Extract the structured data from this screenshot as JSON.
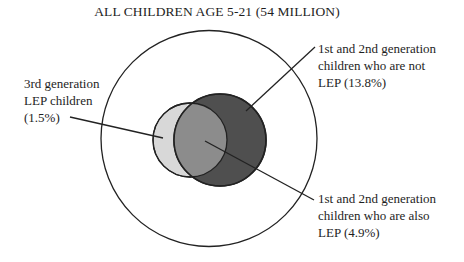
{
  "title": "ALL CHILDREN AGE 5-21 (54 MILLION)",
  "colors": {
    "outer_fill": "#ffffff",
    "third_gen_lep_fill": "#d8d8d8",
    "overlap_fill": "#8c8c8c",
    "first_second_gen_fill": "#4f4f4f",
    "stroke": "#222222"
  },
  "labels": {
    "third_gen": {
      "lines": [
        "3rd generation",
        "LEP children",
        "(1.5%)"
      ]
    },
    "not_lep": {
      "lines": [
        "1st and 2nd generation",
        "children who are not",
        "LEP (13.8%)"
      ]
    },
    "also_lep": {
      "lines": [
        "1st and 2nd generation",
        "children who are also",
        "LEP (4.9%)"
      ]
    }
  },
  "sets": [
    {
      "name": "All children age 5-21",
      "value": "54 million"
    },
    {
      "name": "3rd generation LEP children",
      "value": "1.5%"
    },
    {
      "name": "1st and 2nd generation children who are not LEP",
      "value": "13.8%"
    },
    {
      "name": "1st and 2nd generation children who are also LEP",
      "value": "4.9%"
    }
  ]
}
